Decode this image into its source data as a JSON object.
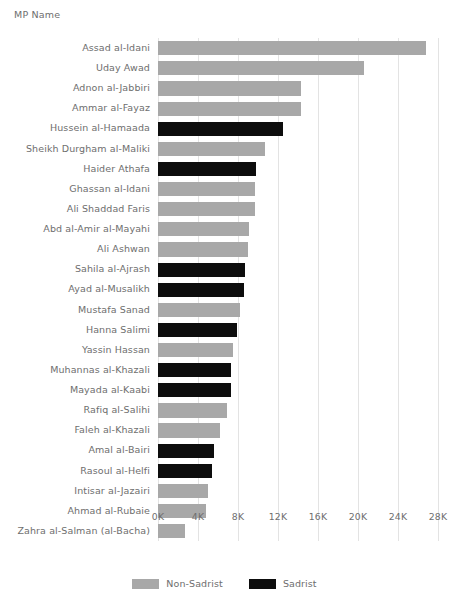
{
  "chart_data": {
    "type": "bar",
    "orientation": "horizontal",
    "title": "",
    "ylabel": "MP Name",
    "xlabel": "",
    "xlim": [
      0,
      28000
    ],
    "xticks": [
      0,
      4000,
      8000,
      12000,
      16000,
      20000,
      24000,
      28000
    ],
    "xtick_labels": [
      "0K",
      "4K",
      "8K",
      "12K",
      "16K",
      "20K",
      "24K",
      "28K"
    ],
    "grid": "vertical",
    "legend_position": "bottom",
    "legend": [
      {
        "name": "Non-Sadrist",
        "color": "#a8a8a8"
      },
      {
        "name": "Sadrist",
        "color": "#0d0d0d"
      }
    ],
    "categories": [
      "Assad al-Idani",
      "Uday Awad",
      "Adnon al-Jabbiri",
      "Ammar al-Fayaz",
      "Hussein al-Hamaada",
      "Sheikh Durgham al-Maliki",
      "Haider Athafa",
      "Ghassan al-Idani",
      "Ali Shaddad Faris",
      "Abd al-Amir al-Mayahi",
      "Ali Ashwan",
      "Sahila al-Ajrash",
      "Ayad al-Musalikh",
      "Mustafa Sanad",
      "Hanna Salimi",
      "Yassin Hassan",
      "Muhannas al-Khazali",
      "Mayada al-Kaabi",
      "Rafiq al-Salihi",
      "Faleh al-Khazali",
      "Amal al-Bairi",
      "Rasoul al-Helfi",
      "Intisar al-Jazairi",
      "Ahmad al-Rubaie",
      "Zahra al-Salman (al-Bacha)"
    ],
    "values": [
      26800,
      20600,
      14300,
      14300,
      12500,
      10700,
      9800,
      9700,
      9700,
      9100,
      9000,
      8700,
      8600,
      8200,
      7900,
      7500,
      7300,
      7300,
      6900,
      6200,
      5600,
      5400,
      5000,
      4800,
      2700
    ],
    "groups": [
      "Non-Sadrist",
      "Non-Sadrist",
      "Non-Sadrist",
      "Non-Sadrist",
      "Sadrist",
      "Non-Sadrist",
      "Sadrist",
      "Non-Sadrist",
      "Non-Sadrist",
      "Non-Sadrist",
      "Non-Sadrist",
      "Sadrist",
      "Sadrist",
      "Non-Sadrist",
      "Sadrist",
      "Non-Sadrist",
      "Sadrist",
      "Sadrist",
      "Non-Sadrist",
      "Non-Sadrist",
      "Sadrist",
      "Sadrist",
      "Non-Sadrist",
      "Non-Sadrist",
      "Non-Sadrist"
    ]
  }
}
